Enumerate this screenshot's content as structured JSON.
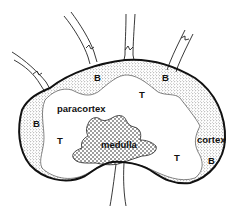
{
  "diagram": {
    "labels": {
      "b_top_left": "B",
      "b_top_right": "B",
      "b_left": "B",
      "b_right": "B",
      "t_top": "T",
      "t_left": "T",
      "t_right": "T",
      "paracortex": "paracortex",
      "medulla": "medulla",
      "cortex": "cortex"
    },
    "colors": {
      "outline": "#111111",
      "background": "#ffffff",
      "stipple": "#333333"
    }
  }
}
